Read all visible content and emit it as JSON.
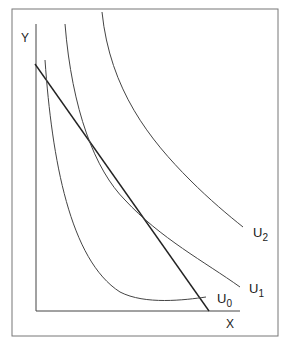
{
  "diagram": {
    "type": "indifference-curves-budget-line",
    "axis_labels": {
      "y": "Y",
      "x": "X"
    },
    "curves": [
      {
        "name": "U0",
        "base": "U",
        "sub": "0"
      },
      {
        "name": "U1",
        "base": "U",
        "sub": "1"
      },
      {
        "name": "U2",
        "base": "U",
        "sub": "2"
      }
    ],
    "budget_line": {
      "label": ""
    },
    "colors": {
      "line": "#333333",
      "frame": "#777777",
      "background": "#ffffff"
    }
  }
}
